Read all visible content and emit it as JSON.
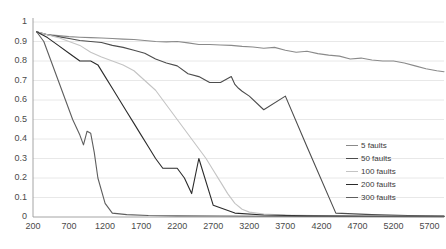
{
  "chart_data": {
    "type": "line",
    "title": "",
    "xlabel": "",
    "ylabel": "",
    "xlim": [
      200,
      5900
    ],
    "ylim": [
      0,
      1
    ],
    "xticks": [
      200,
      700,
      1200,
      1700,
      2200,
      2700,
      3200,
      3700,
      4200,
      4700,
      5200,
      5700
    ],
    "yticks": [
      "0",
      "0.1",
      "0.2",
      "0.3",
      "0.4",
      "0.5",
      "0.6",
      "0.7",
      "0.8",
      "0.9",
      "1"
    ],
    "grid": "horizontal",
    "legend_position": "right",
    "series": [
      {
        "name": "5 faults",
        "color": "#8a8a8a",
        "x": [
          250,
          400,
          550,
          700,
          850,
          1000,
          1150,
          1300,
          1450,
          1600,
          1750,
          1900,
          2050,
          2200,
          2350,
          2500,
          2650,
          2800,
          2950,
          3100,
          3250,
          3400,
          3550,
          3700,
          3850,
          4000,
          4150,
          4300,
          4450,
          4600,
          4750,
          4900,
          5050,
          5200,
          5350,
          5500,
          5650,
          5800,
          5900
        ],
        "y": [
          0.95,
          0.935,
          0.93,
          0.925,
          0.922,
          0.92,
          0.918,
          0.915,
          0.912,
          0.91,
          0.905,
          0.9,
          0.898,
          0.9,
          0.893,
          0.885,
          0.885,
          0.882,
          0.88,
          0.875,
          0.872,
          0.865,
          0.87,
          0.855,
          0.845,
          0.85,
          0.838,
          0.83,
          0.825,
          0.81,
          0.815,
          0.805,
          0.8,
          0.8,
          0.79,
          0.775,
          0.76,
          0.75,
          0.745
        ]
      },
      {
        "name": "50 faults",
        "color": "#4d4d4d",
        "x": [
          250,
          400,
          550,
          700,
          850,
          1000,
          1150,
          1300,
          1450,
          1600,
          1750,
          1900,
          2050,
          2200,
          2350,
          2500,
          2650,
          2800,
          2950,
          3000,
          3050,
          3100,
          3200,
          3400,
          3700,
          4000,
          4400,
          4900,
          5400,
          5900
        ],
        "y": [
          0.95,
          0.935,
          0.925,
          0.915,
          0.905,
          0.9,
          0.895,
          0.88,
          0.87,
          0.855,
          0.84,
          0.81,
          0.79,
          0.775,
          0.735,
          0.72,
          0.69,
          0.69,
          0.72,
          0.68,
          0.66,
          0.645,
          0.62,
          0.55,
          0.62,
          0.36,
          0.02,
          0.012,
          0.008,
          0.005
        ]
      },
      {
        "name": "100 faults",
        "color": "#c4c4c4",
        "x": [
          250,
          400,
          550,
          700,
          850,
          1000,
          1150,
          1300,
          1450,
          1600,
          1750,
          1900,
          2000,
          2100,
          2200,
          2300,
          2400,
          2500,
          2600,
          2700,
          2800,
          2900,
          3000,
          3100,
          3200,
          3400,
          3700,
          4100,
          4600,
          5200,
          5900
        ],
        "y": [
          0.95,
          0.935,
          0.92,
          0.9,
          0.88,
          0.845,
          0.82,
          0.8,
          0.78,
          0.75,
          0.7,
          0.65,
          0.6,
          0.55,
          0.5,
          0.45,
          0.4,
          0.35,
          0.3,
          0.24,
          0.18,
          0.12,
          0.07,
          0.04,
          0.025,
          0.015,
          0.01,
          0.008,
          0.006,
          0.004,
          0.003
        ]
      },
      {
        "name": "200 faults",
        "color": "#2b2b2b",
        "x": [
          250,
          400,
          550,
          700,
          850,
          1000,
          1100,
          1200,
          1300,
          1400,
          1500,
          1600,
          1700,
          1800,
          1900,
          2000,
          2100,
          2200,
          2300,
          2400,
          2500,
          2700,
          3000,
          3400,
          4000,
          4800,
          5900
        ],
        "y": [
          0.95,
          0.92,
          0.88,
          0.84,
          0.8,
          0.8,
          0.78,
          0.72,
          0.66,
          0.6,
          0.54,
          0.48,
          0.42,
          0.36,
          0.3,
          0.25,
          0.25,
          0.25,
          0.2,
          0.12,
          0.3,
          0.06,
          0.02,
          0.01,
          0.006,
          0.004,
          0.003
        ]
      },
      {
        "name": "300 faults",
        "color": "#5e5e5e",
        "x": [
          250,
          350,
          450,
          550,
          650,
          750,
          850,
          900,
          950,
          1000,
          1050,
          1100,
          1200,
          1300,
          1500,
          1800,
          2200,
          2800,
          3600,
          4600,
          5900
        ],
        "y": [
          0.95,
          0.9,
          0.8,
          0.7,
          0.6,
          0.5,
          0.42,
          0.37,
          0.44,
          0.43,
          0.33,
          0.2,
          0.07,
          0.02,
          0.012,
          0.008,
          0.006,
          0.005,
          0.004,
          0.003,
          0.002
        ]
      }
    ]
  },
  "legend": {
    "items": [
      {
        "label": "5 faults"
      },
      {
        "label": "50 faults"
      },
      {
        "label": "100 faults"
      },
      {
        "label": "200 faults"
      },
      {
        "label": "300 faults"
      }
    ]
  }
}
